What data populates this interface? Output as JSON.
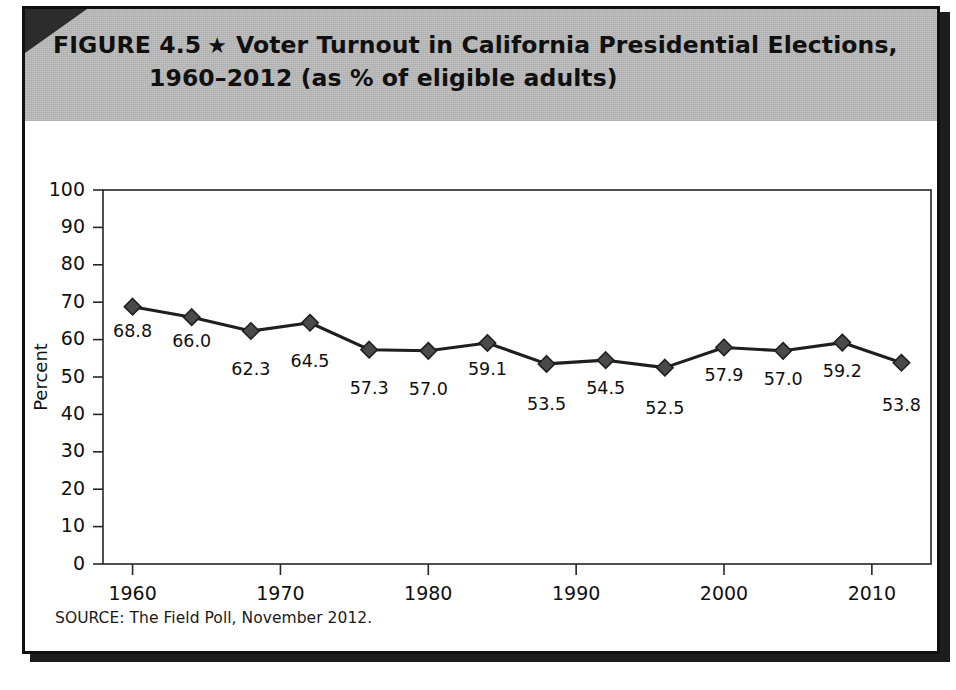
{
  "figure": {
    "label": "FIGURE 4.5",
    "star_icon": "★",
    "title_line_1": "Voter Turnout in California Presidential Elections,",
    "title_line_2": "1960–2012 (as % of eligible adults)",
    "source": "SOURCE: The Field Poll, November 2012.",
    "banner_color": "#bdbdbd",
    "border_color": "#101010",
    "line_color": "#1f1f1f",
    "marker_color": "#4a4a4a"
  },
  "chart_data": {
    "type": "line",
    "title": "Voter Turnout in California Presidential Elections, 1960–2012 (as % of eligible adults)",
    "xlabel": "",
    "ylabel": "Percent",
    "x": [
      1960,
      1964,
      1968,
      1972,
      1976,
      1980,
      1984,
      1988,
      1992,
      1996,
      2000,
      2004,
      2008,
      2012
    ],
    "values": [
      68.8,
      66.0,
      62.3,
      64.5,
      57.3,
      57.0,
      59.1,
      53.5,
      54.5,
      52.5,
      57.9,
      57.0,
      59.2,
      53.8
    ],
    "point_labels": [
      "68.8",
      "66.0",
      "62.3",
      "64.5",
      "57.3",
      "57.0",
      "59.1",
      "53.5",
      "54.5",
      "52.5",
      "57.9",
      "57.0",
      "59.2",
      "53.8"
    ],
    "ylim": [
      0,
      100
    ],
    "yticks": [
      0,
      10,
      20,
      30,
      40,
      50,
      60,
      70,
      80,
      90,
      100
    ],
    "ytick_labels": [
      "0",
      "10",
      "20",
      "30",
      "40",
      "50",
      "60",
      "70",
      "80",
      "90",
      "100"
    ],
    "xlim": [
      1958,
      2014
    ],
    "xticks": [
      1960,
      1970,
      1980,
      1990,
      2000,
      2010
    ],
    "xtick_labels": [
      "1960",
      "1970",
      "1980",
      "1990",
      "2000",
      "2010"
    ],
    "grid": false,
    "legend": false,
    "series": [
      {
        "name": "Voter turnout",
        "values": [
          68.8,
          66.0,
          62.3,
          64.5,
          57.3,
          57.0,
          59.1,
          53.5,
          54.5,
          52.5,
          57.9,
          57.0,
          59.2,
          53.8
        ]
      }
    ]
  }
}
